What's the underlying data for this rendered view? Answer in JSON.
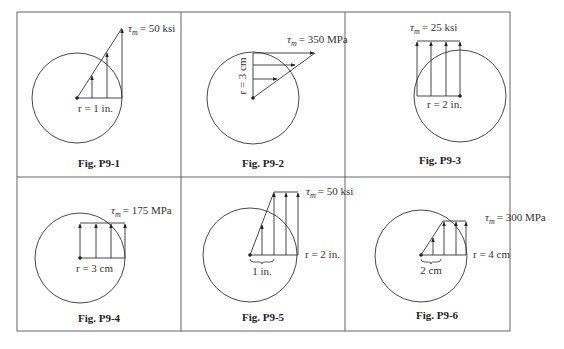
{
  "header_fragment": "Determine the torque T ...",
  "figures": [
    {
      "id": "P9-1",
      "caption": "Fig. P9-1",
      "tau_label": "τ",
      "tau_sub": "m",
      "tau_value": "= 50 ksi",
      "radius_label": "r = 1 in.",
      "distribution": "linear"
    },
    {
      "id": "P9-2",
      "caption": "Fig. P9-2",
      "tau_label": "τ",
      "tau_sub": "m",
      "tau_value": "= 350 MPa",
      "radius_label": "r = 3 cm",
      "distribution": "linear"
    },
    {
      "id": "P9-3",
      "caption": "Fig. P9-3",
      "tau_label": "τ",
      "tau_sub": "m",
      "tau_value": "= 25 ksi",
      "radius_label": "r = 2 in.",
      "distribution": "uniform"
    },
    {
      "id": "P9-4",
      "caption": "Fig. P9-4",
      "tau_label": "τ",
      "tau_sub": "m",
      "tau_value": "= 175 MPa",
      "radius_label": "r = 3 cm",
      "distribution": "uniform"
    },
    {
      "id": "P9-5",
      "caption": "Fig. P9-5",
      "tau_label": "τ",
      "tau_sub": "m",
      "tau_value": "= 50 ksi",
      "radius_label": "r = 2 in.",
      "inner_label": "1 in.",
      "distribution": "linear-then-uniform"
    },
    {
      "id": "P9-6",
      "caption": "Fig. P9-6",
      "tau_label": "τ",
      "tau_sub": "m",
      "tau_value": "= 300 MPa",
      "radius_label": "r = 4 cm",
      "inner_label": "2 cm",
      "distribution": "linear-then-uniform"
    }
  ],
  "colors": {
    "line": "#333333",
    "border": "#555555",
    "background": "#ffffff"
  }
}
